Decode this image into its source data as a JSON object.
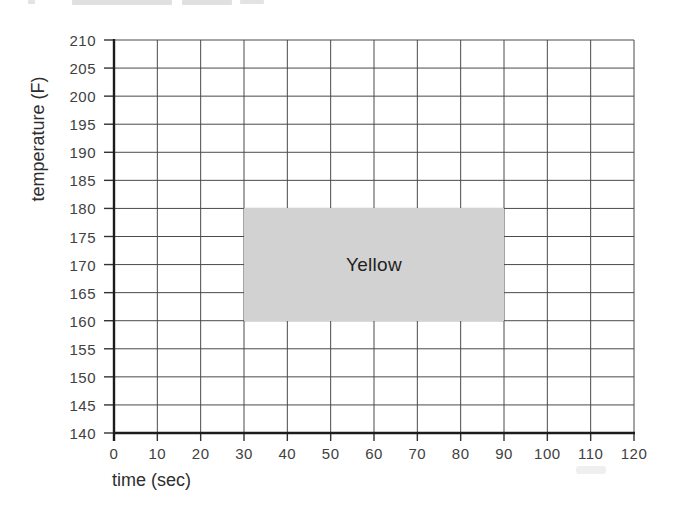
{
  "chart_data": {
    "type": "area",
    "title": "",
    "xlabel": "time (sec)",
    "ylabel": "temperature (F)",
    "xlim": [
      0,
      120
    ],
    "ylim": [
      140,
      210
    ],
    "x_ticks": [
      0,
      10,
      20,
      30,
      40,
      50,
      60,
      70,
      80,
      90,
      100,
      110,
      120
    ],
    "y_ticks": [
      140,
      145,
      150,
      155,
      160,
      165,
      170,
      175,
      180,
      185,
      190,
      195,
      200,
      205,
      210
    ],
    "grid": true,
    "legend": "none",
    "regions": [
      {
        "label": "Yellow",
        "x_start": 30,
        "x_end": 90,
        "y_start": 160,
        "y_end": 180,
        "fill": "#d2d2d2",
        "label_color": "#1f1f1f"
      }
    ],
    "colors": {
      "grid_line": "#4a4a4a",
      "axis_line": "#1c1c1c",
      "tick_text": "#414141",
      "axis_title_text": "#2e2e2e",
      "background": "#ffffff"
    }
  }
}
